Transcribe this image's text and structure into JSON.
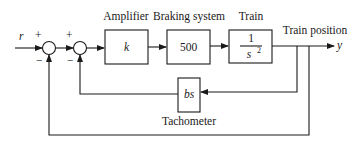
{
  "diagram": {
    "type": "block-diagram",
    "input": {
      "label": "r"
    },
    "output": {
      "label": "y",
      "caption": "Train position"
    },
    "summing_junctions": [
      {
        "id": "sum1",
        "plus_sign": "+",
        "minus_sign": "−"
      },
      {
        "id": "sum2",
        "plus_sign": "+",
        "minus_sign": "−"
      }
    ],
    "blocks": [
      {
        "id": "amplifier",
        "title": "Amplifier",
        "content": "k"
      },
      {
        "id": "braking",
        "title": "Braking system",
        "content": "500"
      },
      {
        "id": "train",
        "title": "Train",
        "numerator": "1",
        "denominator": "s",
        "exponent": "2"
      },
      {
        "id": "tachometer",
        "title": "Tachometer",
        "content": "bs"
      }
    ],
    "connections": [
      {
        "from": "r",
        "to": "sum1",
        "sign": "+"
      },
      {
        "from": "sum1",
        "to": "sum2",
        "sign": "+"
      },
      {
        "from": "sum2",
        "to": "amplifier"
      },
      {
        "from": "amplifier",
        "to": "braking"
      },
      {
        "from": "braking",
        "to": "train"
      },
      {
        "from": "train",
        "to": "y"
      },
      {
        "from": "y",
        "to": "tachometer"
      },
      {
        "from": "tachometer",
        "to": "sum2",
        "sign": "−"
      },
      {
        "from": "y",
        "to": "sum1",
        "sign": "−"
      }
    ]
  }
}
